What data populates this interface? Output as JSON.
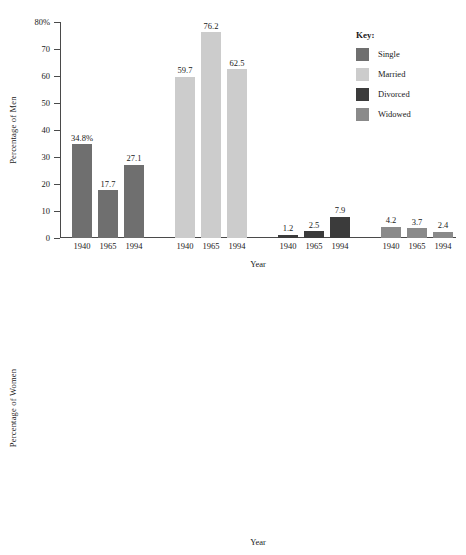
{
  "legend": {
    "title": "Key:",
    "entries": [
      {
        "label": "Single",
        "color": "#6f6f6f"
      },
      {
        "label": "Married",
        "color": "#cccccc"
      },
      {
        "label": "Divorced",
        "color": "#3b3b3b"
      },
      {
        "label": "Widowed",
        "color": "#8a8a8a"
      }
    ]
  },
  "chart_data": [
    {
      "type": "bar",
      "title": "",
      "xlabel": "Year",
      "ylabel": "Percentage of Men",
      "ylim": [
        0,
        80
      ],
      "yticks": [
        0,
        10,
        20,
        30,
        40,
        50,
        60,
        70,
        80
      ],
      "ytick_labels": [
        "0",
        "10",
        "20",
        "30",
        "40",
        "50",
        "60",
        "70",
        "80%"
      ],
      "grid": false,
      "categories": [
        "1940",
        "1965",
        "1994"
      ],
      "groups": [
        "Single",
        "Married",
        "Divorced",
        "Widowed"
      ],
      "series": [
        {
          "name": "Single",
          "color": "#6f6f6f",
          "values": [
            34.8,
            17.7,
            27.1
          ],
          "labels": [
            "34.8%",
            "17.7",
            "27.1"
          ]
        },
        {
          "name": "Married",
          "color": "#cccccc",
          "values": [
            59.7,
            76.2,
            62.5
          ],
          "labels": [
            "59.7",
            "76.2",
            "62.5"
          ]
        },
        {
          "name": "Divorced",
          "color": "#3b3b3b",
          "values": [
            1.2,
            2.5,
            7.9
          ],
          "labels": [
            "1.2",
            "2.5",
            "7.9"
          ]
        },
        {
          "name": "Widowed",
          "color": "#8a8a8a",
          "values": [
            4.2,
            3.7,
            2.4
          ],
          "labels": [
            "4.2",
            "3.7",
            "2.4"
          ]
        }
      ]
    },
    {
      "type": "bar",
      "title": "",
      "xlabel": "Year",
      "ylabel": "Percentage of Women",
      "ylim": [
        0,
        80
      ],
      "yticks": [
        0,
        10,
        20,
        30,
        40,
        50,
        60,
        70,
        80
      ],
      "ytick_labels": [
        "0",
        "10",
        "20",
        "30",
        "40",
        "50",
        "60",
        "70",
        "80%"
      ],
      "grid": false,
      "categories": [
        "1940",
        "1965",
        "1994"
      ],
      "groups": [
        "Single",
        "Married",
        "Divorced",
        "Widowed"
      ],
      "series": [
        {
          "name": "Single",
          "color": "#6f6f6f",
          "values": [
            27.6,
            12.4,
            19.7
          ],
          "labels": [
            "27.6%",
            "12.4",
            "19.7"
          ]
        },
        {
          "name": "Married",
          "color": "#cccccc",
          "values": [
            59.5,
            70.5,
            58.8
          ],
          "labels": [
            "59.5",
            "70.5",
            "58.8"
          ]
        },
        {
          "name": "Divorced",
          "color": "#3b3b3b",
          "values": [
            1.6,
            3.3,
            10.2
          ],
          "labels": [
            "1.6",
            "3.3",
            "10.2"
          ]
        },
        {
          "name": "Widowed",
          "color": "#8a8a8a",
          "values": [
            11.3,
            13.8,
            11.2
          ],
          "labels": [
            "11.3",
            "13.8",
            "11.2"
          ]
        }
      ]
    }
  ]
}
